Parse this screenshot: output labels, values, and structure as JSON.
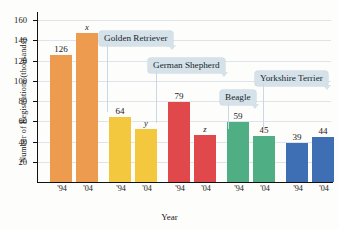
{
  "chart_data": {
    "type": "bar",
    "title": "",
    "xlabel": "Year",
    "ylabel": "Number of Registrations (thousands)",
    "ylim": [
      0,
      168
    ],
    "yticks": [
      20,
      40,
      60,
      80,
      100,
      120,
      140,
      160
    ],
    "grid": true,
    "legend_position": "none",
    "categories": [
      "'94",
      "'04",
      "'94",
      "'04",
      "'94",
      "'04",
      "'94",
      "'04",
      "'94",
      "'04"
    ],
    "groups": [
      {
        "name": "Labrador Retriever",
        "color": "#ED9B4E",
        "labeled": false,
        "bars": [
          {
            "year": "'94",
            "value": 126,
            "label": "126",
            "italic": false
          },
          {
            "year": "'04",
            "value": 147,
            "label": "x",
            "italic": true
          }
        ]
      },
      {
        "name": "Golden Retriever",
        "color": "#F3C83F",
        "labeled": true,
        "bars": [
          {
            "year": "'94",
            "value": 64,
            "label": "64",
            "italic": false
          },
          {
            "year": "'04",
            "value": 52,
            "label": "y",
            "italic": true
          }
        ]
      },
      {
        "name": "German Shepherd",
        "color": "#E1484B",
        "labeled": true,
        "bars": [
          {
            "year": "'94",
            "value": 79,
            "label": "79",
            "italic": false
          },
          {
            "year": "'04",
            "value": 46,
            "label": "z",
            "italic": true
          }
        ]
      },
      {
        "name": "Beagle",
        "color": "#4FAE83",
        "labeled": true,
        "bars": [
          {
            "year": "'94",
            "value": 59,
            "label": "59",
            "italic": false
          },
          {
            "year": "'04",
            "value": 45,
            "label": "45",
            "italic": false
          }
        ]
      },
      {
        "name": "Yorkshire Terrier",
        "color": "#3E6FB5",
        "labeled": true,
        "bars": [
          {
            "year": "'94",
            "value": 39,
            "label": "39",
            "italic": false
          },
          {
            "year": "'04",
            "value": 44,
            "label": "44",
            "italic": false
          }
        ]
      }
    ],
    "callouts": [
      {
        "text": "Golden Retriever",
        "x": 99,
        "y": 31
      },
      {
        "text": "German Shepherd",
        "x": 148,
        "y": 58
      },
      {
        "text": "Beagle",
        "x": 220,
        "y": 90
      },
      {
        "text": "Yorkshire Terrier",
        "x": 255,
        "y": 71
      }
    ]
  }
}
